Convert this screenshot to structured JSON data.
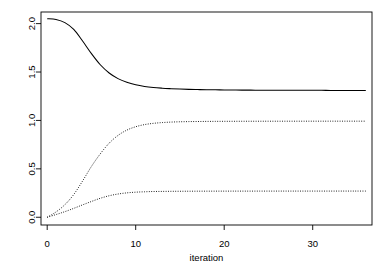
{
  "chart_data": {
    "type": "line",
    "title": "",
    "subtitle": "",
    "xlabel": "iteration",
    "ylabel": "",
    "xlim": [
      -0.7,
      36.7
    ],
    "ylim": [
      -0.08,
      2.12
    ],
    "xticks": [
      0,
      10,
      20,
      30
    ],
    "xticklabels": [
      "0",
      "10",
      "20",
      "30"
    ],
    "yticks": [
      0.0,
      0.5,
      1.0,
      1.5,
      2.0
    ],
    "yticklabels": [
      "0.0",
      "0.5",
      "1.0",
      "1.5",
      "2.0"
    ],
    "grid": false,
    "legend": null,
    "box": true,
    "background": "#ffffff",
    "line_color": "#000000",
    "x": [
      0,
      1,
      2,
      3,
      4,
      5,
      6,
      7,
      8,
      9,
      10,
      11,
      12,
      13,
      14,
      15,
      16,
      17,
      18,
      19,
      20,
      21,
      22,
      23,
      24,
      25,
      26,
      27,
      28,
      29,
      30,
      31,
      32,
      33,
      34,
      35,
      36
    ],
    "series": [
      {
        "name": "trace-1",
        "style": "solid",
        "start": 2.05,
        "plateau": 1.31,
        "values": [
          2.05,
          2.043,
          2.01,
          1.94,
          1.82,
          1.69,
          1.575,
          1.49,
          1.432,
          1.394,
          1.368,
          1.351,
          1.34,
          1.333,
          1.328,
          1.324,
          1.321,
          1.319,
          1.317,
          1.316,
          1.315,
          1.314,
          1.313,
          1.313,
          1.312,
          1.312,
          1.312,
          1.311,
          1.311,
          1.311,
          1.311,
          1.311,
          1.31,
          1.31,
          1.31,
          1.31,
          1.31
        ]
      },
      {
        "name": "trace-2",
        "style": "dotted",
        "start": 0.0,
        "plateau": 0.99,
        "values": [
          0.0,
          0.055,
          0.13,
          0.235,
          0.375,
          0.525,
          0.655,
          0.765,
          0.845,
          0.9,
          0.935,
          0.957,
          0.97,
          0.978,
          0.983,
          0.986,
          0.988,
          0.989,
          0.99,
          0.9905,
          0.991,
          0.9912,
          0.9915,
          0.9917,
          0.9918,
          0.992,
          0.992,
          0.9921,
          0.9922,
          0.9922,
          0.9923,
          0.9923,
          0.9924,
          0.9924,
          0.9924,
          0.9925,
          0.9925
        ]
      },
      {
        "name": "trace-3",
        "style": "dotted",
        "start": 0.0,
        "plateau": 0.27,
        "values": [
          0.0,
          0.028,
          0.058,
          0.092,
          0.128,
          0.163,
          0.196,
          0.222,
          0.24,
          0.252,
          0.259,
          0.263,
          0.266,
          0.267,
          0.268,
          0.2685,
          0.269,
          0.2693,
          0.2695,
          0.2697,
          0.2698,
          0.2699,
          0.27,
          0.27,
          0.2701,
          0.2701,
          0.2702,
          0.2702,
          0.2702,
          0.2703,
          0.2703,
          0.2703,
          0.2703,
          0.2704,
          0.2704,
          0.2704,
          0.2704
        ]
      }
    ]
  },
  "axes": {
    "x_title": "iteration",
    "x_tick_labels": [
      "0",
      "10",
      "20",
      "30"
    ],
    "y_tick_labels": [
      "0.0",
      "0.5",
      "1.0",
      "1.5",
      "2.0"
    ]
  }
}
